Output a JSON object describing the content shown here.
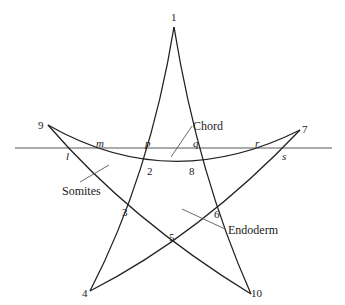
{
  "diagram": {
    "stroke_color": "#222222",
    "background": "#ffffff",
    "vertex_labels": [
      {
        "id": "v1",
        "text": "1",
        "x": 171,
        "y": 12
      },
      {
        "id": "v9",
        "text": "9",
        "x": 38,
        "y": 120
      },
      {
        "id": "v7",
        "text": "7",
        "x": 302,
        "y": 124
      },
      {
        "id": "v4",
        "text": "4",
        "x": 82,
        "y": 288
      },
      {
        "id": "v10",
        "text": "10",
        "x": 251,
        "y": 288
      }
    ],
    "intersection_labels": [
      {
        "id": "p2",
        "text": "2",
        "x": 147,
        "y": 166
      },
      {
        "id": "p8",
        "text": "8",
        "x": 189,
        "y": 166
      },
      {
        "id": "p3",
        "text": "3",
        "x": 122,
        "y": 207
      },
      {
        "id": "p5",
        "text": "5",
        "x": 169,
        "y": 232
      },
      {
        "id": "p6",
        "text": "6",
        "x": 214,
        "y": 209
      }
    ],
    "section_labels": [
      {
        "id": "l",
        "text": "l",
        "x": 66,
        "y": 151
      },
      {
        "id": "m",
        "text": "m",
        "x": 96,
        "y": 138
      },
      {
        "id": "p",
        "text": "p",
        "x": 145,
        "y": 138
      },
      {
        "id": "q",
        "text": "q",
        "x": 193,
        "y": 138
      },
      {
        "id": "r",
        "text": "r",
        "x": 255,
        "y": 138
      },
      {
        "id": "s",
        "text": "s",
        "x": 282,
        "y": 151
      }
    ],
    "tissue_labels": [
      {
        "id": "chord",
        "text": "Chord",
        "x": 193,
        "y": 120
      },
      {
        "id": "somites",
        "text": "Somites",
        "x": 62,
        "y": 185
      },
      {
        "id": "endoderm",
        "text": "Endoderm",
        "x": 228,
        "y": 224
      }
    ]
  }
}
